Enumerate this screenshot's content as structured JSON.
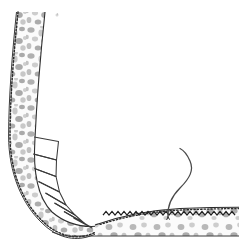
{
  "figure": {
    "domain": "scientific-illustration",
    "alt_text": "Pen-and-ink histological drawing of an L-shaped stippled epithelial band curving from the upper left down and to the right, with segmented cell compartments along the bend, a serrated brush border on the horizontal portion, and a slender S-curved filament rising from the surface.",
    "canvas": {
      "width": 239,
      "height": 250,
      "background_color": "#ffffff"
    },
    "colors": {
      "background": "#ffffff",
      "outline": "#2b2b2b",
      "stipple_light": "#cfcfcf",
      "stipple_mid": "#9a9a9a",
      "stipple_dark": "#7b7b7b",
      "cell_wall": "#3a3a3a",
      "brush_border": "#1e1e1e",
      "filament": "#4a4a4a",
      "tissue_fill": "#fbfbfb"
    },
    "elements": [
      {
        "id": "vertical-band",
        "label": "Vertical stippled epithelial band",
        "description": "Near-vertical band entering from the top edge, about 27 px wide, filled with irregular grey blobs.",
        "x_range": [
          4,
          40
        ],
        "y_range": [
          12,
          140
        ],
        "band_width_px": 27,
        "edge_left": "dotted dense margin",
        "edge_right": "thin solid line"
      },
      {
        "id": "curved-bend",
        "label": "Curved bend with segmented cells",
        "description": "The band sweeps from vertical into horizontal, carrying a row of trapezoidal cell compartments along its inner margin.",
        "x_range": [
          8,
          100
        ],
        "y_range": [
          130,
          238
        ],
        "segment_count": 7
      },
      {
        "id": "horizontal-band",
        "label": "Horizontal stippled epithelial band",
        "description": "Band running to the right edge with a dark sawtooth brush border along its upper surface and a plain baseline below.",
        "x_range": [
          95,
          239
        ],
        "y_range": [
          205,
          238
        ],
        "border_type": "sawtooth brush border"
      },
      {
        "id": "filament",
        "label": "S-curved filament",
        "description": "Slender hair-like strand anchored to the horizontal band surface, curving up and to the right then back.",
        "base_point": [
          168,
          216
        ],
        "tip_point": [
          184,
          150
        ]
      },
      {
        "id": "speck",
        "label": "Faint ink speck",
        "description": "Small isolated mark in the upper area of the plate.",
        "position": [
          57,
          15
        ]
      }
    ],
    "annotations": [],
    "legend": []
  }
}
